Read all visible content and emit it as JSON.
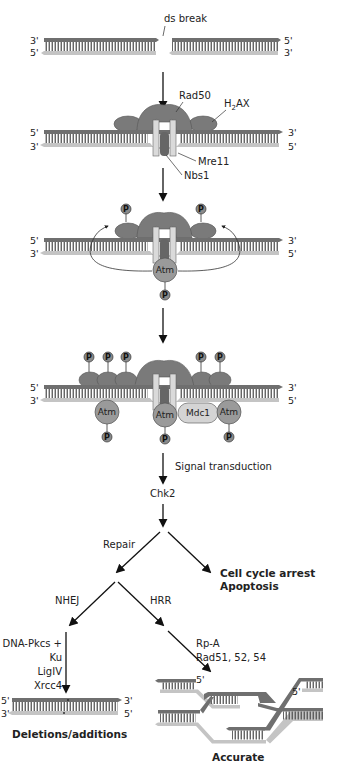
{
  "colors": {
    "strand_dark": "#6f6f6f",
    "strand_light": "#c4c4c4",
    "rung": "#555555",
    "protein_dark": "#7a7a7a",
    "protein_mid": "#8c8c8c",
    "atm": "#9a9a9a",
    "mdc1": "#d4d4d4",
    "phospho": "#8a8a8a",
    "arrow": "#111111"
  },
  "stage1": {
    "label": "ds break",
    "left_top_end": "3'",
    "left_bottom_end": "5'",
    "right_top_end": "5'",
    "right_bottom_end": "3'"
  },
  "stage2": {
    "left_top_end": "5'",
    "left_bottom_end": "3'",
    "right_top_end": "3'",
    "right_bottom_end": "5'",
    "labels": {
      "rad50": "Rad50",
      "h2ax_h": "H",
      "h2ax_sub": "2",
      "h2ax_rest": "AX",
      "mre11": "Mre11",
      "nbs1": "Nbs1"
    }
  },
  "stage3": {
    "left_top_end": "5'",
    "left_bottom_end": "3'",
    "right_top_end": "3'",
    "right_bottom_end": "5'",
    "atm": "Atm",
    "phospho": "P"
  },
  "stage4": {
    "left_top_end": "5'",
    "left_bottom_end": "3'",
    "right_top_end": "3'",
    "right_bottom_end": "5'",
    "atm": "Atm",
    "mdc1": "Mdc1",
    "phospho": "P"
  },
  "pathway": {
    "signal_transduction": "Signal transduction",
    "chk2": "Chk2",
    "repair": "Repair",
    "cell_cycle_arrest": "Cell cycle arrest",
    "apoptosis": "Apoptosis",
    "nhej": "NHEJ",
    "hrr": "HRR",
    "nhej_factors": [
      "DNA-Pkcs +",
      "Ku",
      "LigIV",
      "Xrcc4"
    ],
    "hrr_factors": [
      "Rp-A",
      "Rad51, 52, 54"
    ]
  },
  "outcomes": {
    "nhej_result": "Deletions/additions",
    "nhej_left_top": "5'",
    "nhej_left_bottom": "3'",
    "nhej_right_top": "3'",
    "nhej_right_bottom": "5'",
    "hrr_result": "Accurate",
    "hrr_five_prime_left": "5'",
    "hrr_five_prime_right": "5'"
  }
}
